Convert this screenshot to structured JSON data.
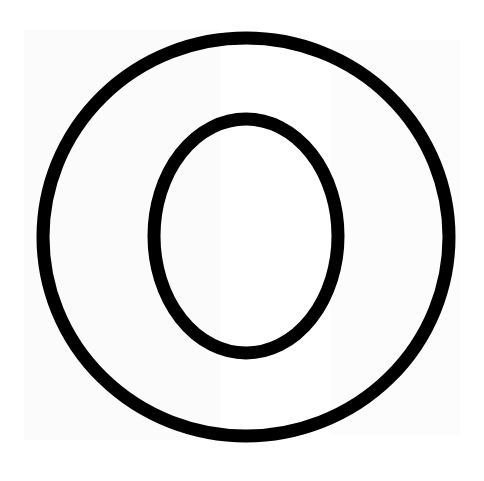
{
  "image": {
    "subject": "Outlined letter O",
    "letter": "O",
    "colors": {
      "background": "#ffffff",
      "stroke": "#000000",
      "fill": "#ffffff"
    },
    "outer_ellipse": {
      "cx": 246,
      "cy": 237,
      "rx": 203,
      "ry": 199,
      "stroke_width": 13
    },
    "inner_ellipse": {
      "cx": 246,
      "cy": 236,
      "rx": 92,
      "ry": 117,
      "stroke_width": 13
    }
  }
}
